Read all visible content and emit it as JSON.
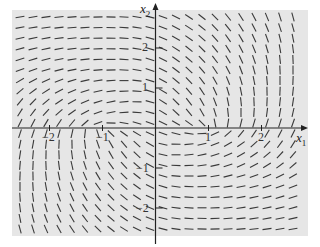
{
  "chart_data": {
    "type": "direction_field",
    "title": "",
    "xlabel": "x1",
    "ylabel": "x2",
    "xlim": [
      -2.8,
      2.8
    ],
    "ylim": [
      -2.7,
      2.9
    ],
    "grid": false,
    "legend": null,
    "x_ticks": [
      -2,
      -1,
      1,
      2
    ],
    "y_ticks": [
      -2,
      -1,
      1,
      2
    ],
    "x_tick_labels": [
      "−2",
      "−1",
      "1",
      "2"
    ],
    "y_tick_labels": [
      "−2",
      "−1",
      "1",
      "2"
    ],
    "background": "#e6e6e6",
    "segment_color": "#3a3a3a",
    "sample_grid": {
      "x1": [
        -2.5,
        -1.5,
        -0.5,
        0.5,
        1.5,
        2.5
      ],
      "x2": [
        2.5,
        1.5,
        0.5,
        -0.5,
        -1.5,
        -2.5
      ],
      "angle_deg": [
        [
          10,
          5,
          -5,
          -30,
          -55,
          -75
        ],
        [
          20,
          10,
          -5,
          -40,
          -65,
          -90
        ],
        [
          55,
          30,
          5,
          -50,
          -85,
          80
        ],
        [
          80,
          -85,
          -50,
          5,
          30,
          55
        ],
        [
          -90,
          -65,
          -40,
          -5,
          10,
          20
        ],
        [
          -75,
          -55,
          -30,
          -5,
          5,
          10
        ]
      ]
    }
  },
  "axes": {
    "x_label_main": "x",
    "x_label_sub": "1",
    "y_label_main": "x",
    "y_label_sub": "2"
  }
}
